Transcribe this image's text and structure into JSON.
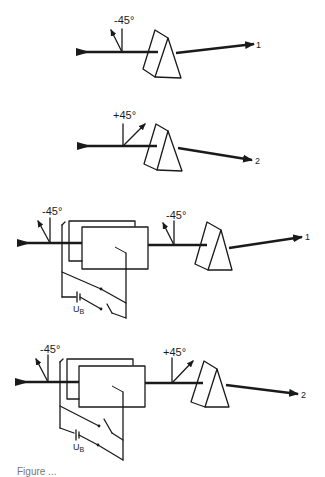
{
  "figure": {
    "caption": "Figure ...",
    "panels": [
      {
        "id": 1,
        "polarizer_label": "-45°",
        "output_label": "1",
        "has_pockels_cell": false
      },
      {
        "id": 2,
        "polarizer_label": "+45°",
        "output_label": "2",
        "has_pockels_cell": false
      },
      {
        "id": 3,
        "input_polarizer_label": "-45°",
        "polarizer_label": "-45°",
        "output_label": "1",
        "has_pockels_cell": true,
        "voltage_label": "U",
        "voltage_subscript": "B"
      },
      {
        "id": 4,
        "input_polarizer_label": "-45°",
        "polarizer_label": "+45°",
        "output_label": "2",
        "has_pockels_cell": true,
        "voltage_label": "U",
        "voltage_subscript": "B"
      }
    ]
  }
}
